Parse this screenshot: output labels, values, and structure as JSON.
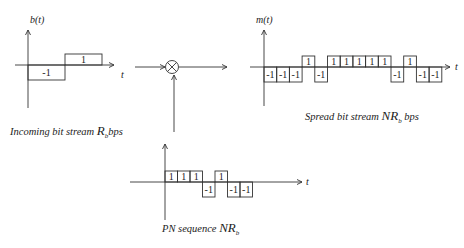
{
  "diagram": {
    "type": "DSSS spreading block diagram",
    "colors": {
      "line": "#333333",
      "text": "#222222",
      "background": "#ffffff"
    },
    "incoming": {
      "axis_label": "b(t)",
      "time_label": "t",
      "bits": [
        -1,
        1
      ],
      "bit_labels": [
        "-1",
        "1"
      ],
      "caption_text": "Incoming bit stream ",
      "caption_symbol": "R",
      "caption_sub": "b",
      "caption_unit": "bps"
    },
    "multiplier": {
      "symbol": "multiply-circle"
    },
    "spread": {
      "axis_label": "m(t)",
      "time_label": "t",
      "bits": [
        -1,
        -1,
        -1,
        1,
        -1,
        1,
        1,
        1,
        1,
        1,
        -1,
        1,
        -1,
        -1
      ],
      "bit_labels": [
        "-1",
        "-1",
        "-1",
        "1",
        "-1",
        "1",
        "1",
        "1",
        "1",
        "1",
        "-1",
        "1",
        "-1",
        "-1"
      ],
      "caption_text": "Spread bit stream ",
      "caption_symbol": "NR",
      "caption_sub": "b",
      "caption_unit": " bps"
    },
    "pn": {
      "time_label": "t",
      "bits": [
        1,
        1,
        1,
        -1,
        1,
        -1,
        -1
      ],
      "bit_labels": [
        "1",
        "1",
        "1",
        "-1",
        "1",
        "-1",
        "-1"
      ],
      "caption_text": "PN sequence ",
      "caption_symbol": "NR",
      "caption_sub": "b"
    }
  }
}
